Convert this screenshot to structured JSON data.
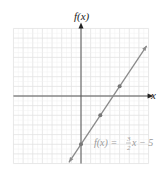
{
  "chart_data": {
    "type": "line",
    "title": "",
    "xlabel": "x",
    "ylabel": "f(x)",
    "xlim": [
      -7,
      7
    ],
    "ylim": [
      -7,
      7
    ],
    "grid": true,
    "series": [
      {
        "name": "f(x) = 3/2 x - 5",
        "equation": "f(x) = (3/2)x - 5",
        "slope": 1.5,
        "intercept": -5,
        "x_range": [
          -1.25,
          6.8
        ],
        "marked_points": [
          {
            "x": 0,
            "y": -5
          },
          {
            "x": 2,
            "y": -2
          },
          {
            "x": 4,
            "y": 1
          }
        ]
      }
    ],
    "annotations": [
      {
        "text": "f(x) = 3/2 x − 5",
        "x": 2.2,
        "y": -5
      }
    ]
  },
  "labels": {
    "y_axis": "f(x)",
    "x_axis": "x",
    "eq_lhs": "f(x) = ",
    "eq_num": "3",
    "eq_den": "2",
    "eq_rhs": "x − 5"
  },
  "colors": {
    "grid": "#e2e2e2",
    "axis": "#555555",
    "line": "#8a8a8a",
    "point": "#777777",
    "annotation": "#9a9a9a"
  }
}
